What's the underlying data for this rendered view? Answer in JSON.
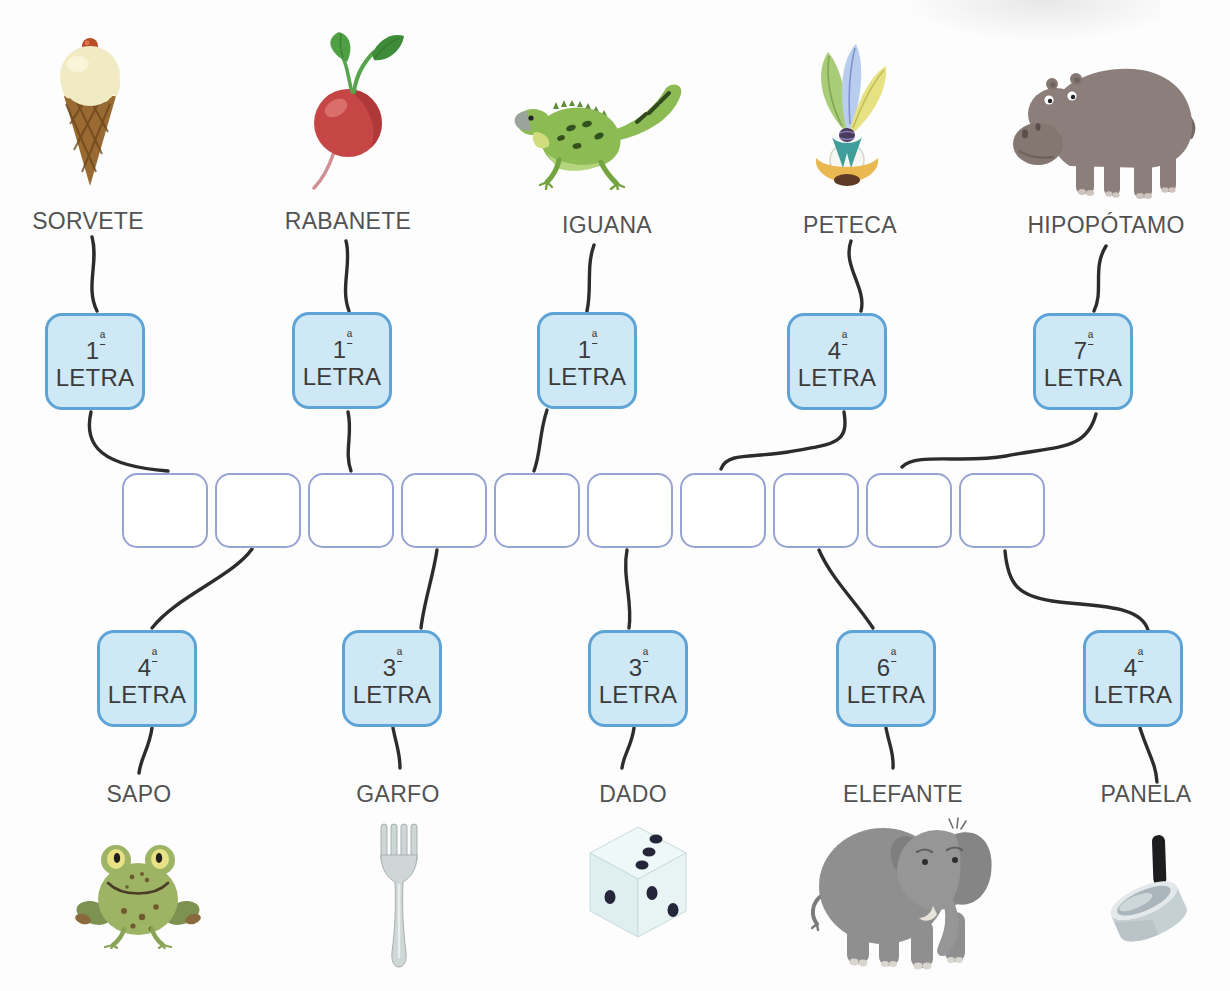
{
  "colors": {
    "letra_fill": "#cfe8f5",
    "letra_border": "#5ea3d6",
    "answer_border": "#97a3d2",
    "connector": "#2c2c2c",
    "label_text": "#525252",
    "box_text": "#3b3b3b"
  },
  "top_row": [
    {
      "word": "SORVETE",
      "icon": "ice-cream-icon",
      "ordinal_number": "1",
      "ordinal_suffix": "ª",
      "box_label": "LETRA"
    },
    {
      "word": "RABANETE",
      "icon": "radish-icon",
      "ordinal_number": "1",
      "ordinal_suffix": "ª",
      "box_label": "LETRA"
    },
    {
      "word": "IGUANA",
      "icon": "iguana-icon",
      "ordinal_number": "1",
      "ordinal_suffix": "ª",
      "box_label": "LETRA"
    },
    {
      "word": "PETECA",
      "icon": "shuttlecock-icon",
      "ordinal_number": "4",
      "ordinal_suffix": "ª",
      "box_label": "LETRA"
    },
    {
      "word": "HIPOPÓTAMO",
      "icon": "hippopotamus-icon",
      "ordinal_number": "7",
      "ordinal_suffix": "ª",
      "box_label": "LETRA"
    }
  ],
  "answer_row": {
    "box_count": 10
  },
  "bottom_row": [
    {
      "word": "SAPO",
      "icon": "frog-icon",
      "ordinal_number": "4",
      "ordinal_suffix": "ª",
      "box_label": "LETRA"
    },
    {
      "word": "GARFO",
      "icon": "fork-icon",
      "ordinal_number": "3",
      "ordinal_suffix": "ª",
      "box_label": "LETRA"
    },
    {
      "word": "DADO",
      "icon": "dice-icon",
      "ordinal_number": "3",
      "ordinal_suffix": "ª",
      "box_label": "LETRA"
    },
    {
      "word": "ELEFANTE",
      "icon": "elephant-icon",
      "ordinal_number": "6",
      "ordinal_suffix": "ª",
      "box_label": "LETRA"
    },
    {
      "word": "PANELA",
      "icon": "saucepan-icon",
      "ordinal_number": "4",
      "ordinal_suffix": "ª",
      "box_label": "LETRA"
    }
  ]
}
